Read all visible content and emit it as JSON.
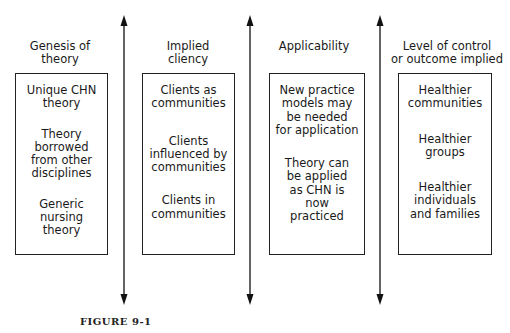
{
  "columns": [
    {
      "heading": [
        "Genesis of",
        "theory"
      ],
      "items": [
        [
          "Unique CHN",
          "theory"
        ],
        [
          "Theory",
          "borrowed",
          "from other",
          "disciplines"
        ],
        [
          "Generic",
          "nursing",
          "theory"
        ]
      ]
    },
    {
      "heading": [
        "Implied",
        "cliency"
      ],
      "items": [
        [
          "Clients as",
          "communities"
        ],
        [
          "Clients",
          "influenced by",
          "communities"
        ],
        [
          "Clients in",
          "communities"
        ]
      ]
    },
    {
      "heading": [
        "Applicability"
      ],
      "items": [
        [
          "New practice",
          "models may",
          "be needed",
          "for application"
        ],
        [
          "Theory can",
          "be applied",
          "as CHN is",
          "now",
          "practiced"
        ]
      ]
    },
    {
      "heading": [
        "Level of control",
        "or outcome implied"
      ],
      "items": [
        [
          "Healthier",
          "communities"
        ],
        [
          "Healthier",
          "groups"
        ],
        [
          "Healthier",
          "individuals",
          "and families"
        ]
      ]
    }
  ],
  "arrows": [
    {
      "type": "double-headed-vertical"
    },
    {
      "type": "double-headed-vertical"
    },
    {
      "type": "double-headed-vertical"
    }
  ],
  "caption": "FIGURE 9-1"
}
